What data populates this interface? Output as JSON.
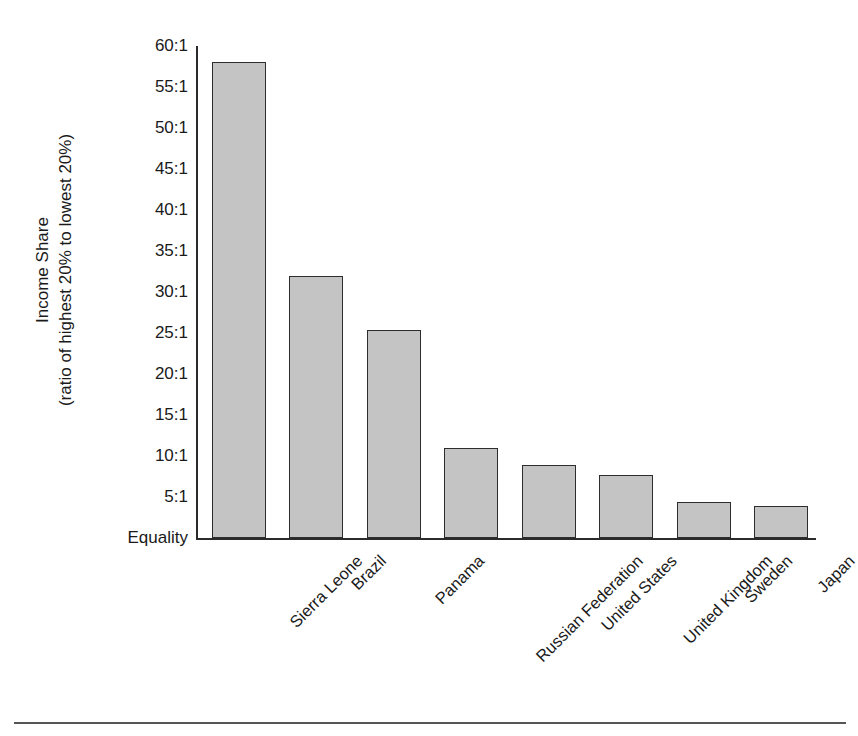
{
  "chart_data": {
    "type": "bar",
    "title": "",
    "subtitle": "",
    "xlabel": "",
    "ylabel": "Income Share (ratio of highest 20% to lowest 20%)",
    "ylabel_lines": [
      "Income Share",
      "(ratio of highest 20% to lowest 20%)"
    ],
    "categories": [
      "Sierra Leone",
      "Brazil",
      "Panama",
      "Russian Federation",
      "United States",
      "United Kingdom",
      "Sweden",
      "Japan"
    ],
    "values": [
      58.0,
      32.0,
      25.4,
      11.0,
      8.9,
      7.7,
      4.4,
      3.9
    ],
    "value_labels": [
      "58:1",
      "32:1",
      "25.4:1",
      "11:1",
      "8.9:1",
      "7.7:1",
      "4.4:1",
      "3.9:1"
    ],
    "ylim": [
      0,
      60
    ],
    "ytick_values": [
      0,
      5,
      10,
      15,
      20,
      25,
      30,
      35,
      40,
      45,
      50,
      55,
      60
    ],
    "ytick_labels": [
      "Equality",
      "5:1",
      "10:1",
      "15:1",
      "20:1",
      "25:1",
      "30:1",
      "35:1",
      "40:1",
      "45:1",
      "50:1",
      "55:1",
      "60:1"
    ],
    "grid": false,
    "legend": false,
    "legend_position": "none",
    "bar_fill_color": "#c4c4c4",
    "bar_edge_color": "#2d2d2d",
    "axis_color": "#2b2b2b",
    "background_color": "#ffffff",
    "xtick_label_rotation": -45
  }
}
